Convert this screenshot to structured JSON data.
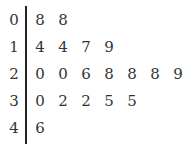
{
  "chart_data": {
    "type": "table",
    "subtype": "stem-and-leaf",
    "title": "",
    "rows": [
      {
        "stem": "0",
        "leaves": [
          "8",
          "8"
        ]
      },
      {
        "stem": "1",
        "leaves": [
          "4",
          "4",
          "7",
          "9"
        ]
      },
      {
        "stem": "2",
        "leaves": [
          "0",
          "0",
          "6",
          "8",
          "8",
          "8",
          "9"
        ]
      },
      {
        "stem": "3",
        "leaves": [
          "0",
          "2",
          "2",
          "5",
          "5"
        ]
      },
      {
        "stem": "4",
        "leaves": [
          "6"
        ]
      }
    ],
    "values": [
      8,
      8,
      14,
      14,
      17,
      19,
      20,
      20,
      26,
      28,
      28,
      28,
      29,
      30,
      32,
      32,
      35,
      35,
      46
    ]
  }
}
